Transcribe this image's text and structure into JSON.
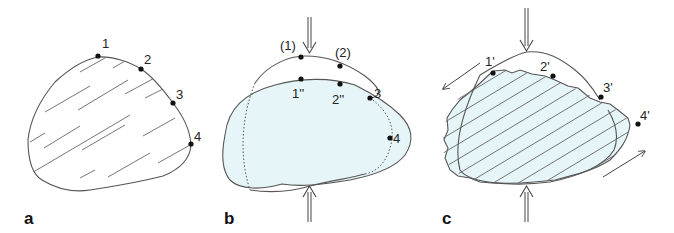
{
  "figure": {
    "fill_color": "#e6f5f8",
    "stroke_color": "#555555",
    "panels": [
      {
        "id": "a",
        "label": "a",
        "points": [
          "1",
          "2",
          "3",
          "4"
        ]
      },
      {
        "id": "b",
        "label": "b",
        "points_original": [
          "(1)",
          "(2)",
          "3",
          "4"
        ],
        "points_compressed": [
          "1''",
          "2''"
        ]
      },
      {
        "id": "c",
        "label": "c",
        "points": [
          "1'",
          "2'",
          "3'",
          "4'"
        ]
      }
    ]
  }
}
